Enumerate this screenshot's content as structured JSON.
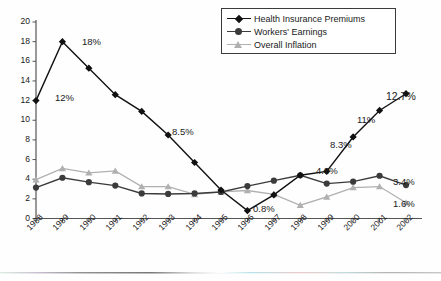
{
  "chart_data": {
    "type": "line",
    "title": "",
    "subtitle": "",
    "xlabel": "",
    "ylabel": "",
    "ylim": [
      0,
      20
    ],
    "ytick_step": 2,
    "grid": false,
    "legend_position": "top-right",
    "categories": [
      "1988",
      "1989",
      "1990",
      "1991",
      "1992",
      "1993",
      "1994",
      "1995",
      "1996",
      "1997",
      "1998",
      "1999",
      "2000",
      "2001",
      "2002"
    ],
    "yticks": [
      "0",
      "2",
      "4",
      "6",
      "8",
      "10",
      "12",
      "14",
      "16",
      "18",
      "20"
    ],
    "series": [
      {
        "name": "Health Insurance Premiums",
        "marker": "diamond",
        "color": "#111111",
        "values": [
          12,
          18,
          15.3,
          12.6,
          10.9,
          8.5,
          5.7,
          2.9,
          0.8,
          2.4,
          4.4,
          4.8,
          8.3,
          11,
          12.7
        ]
      },
      {
        "name": "Workers' Earnings",
        "marker": "circle",
        "color": "#3b3b3b",
        "values": [
          3.15,
          4.15,
          3.7,
          3.35,
          2.55,
          2.5,
          2.55,
          2.7,
          3.3,
          3.85,
          4.4,
          3.55,
          3.75,
          4.35,
          3.4
        ]
      },
      {
        "name": "Overall Inflation",
        "marker": "triangle",
        "color": "#b0b0b0",
        "values": [
          3.95,
          5.1,
          4.65,
          4.85,
          3.25,
          3.25,
          2.45,
          2.7,
          2.85,
          2.45,
          1.35,
          2.2,
          3.15,
          3.25,
          1.6
        ]
      }
    ],
    "annotations": [
      {
        "text": "12%",
        "series": "Health Insurance Premiums",
        "year": "1988",
        "x": 55,
        "y": 93
      },
      {
        "text": "18%",
        "series": "Health Insurance Premiums",
        "year": "1989",
        "x": 82,
        "y": 37
      },
      {
        "text": "8.5%",
        "series": "Health Insurance Premiums",
        "year": "1993",
        "x": 172,
        "y": 127
      },
      {
        "text": "0.8%",
        "series": "Health Insurance Premiums",
        "year": "1996",
        "x": 253,
        "y": 204
      },
      {
        "text": "4.8%",
        "series": "Health Insurance Premiums",
        "year": "1999",
        "x": 316,
        "y": 166
      },
      {
        "text": "8.3%",
        "series": "Health Insurance Premiums",
        "year": "2000",
        "x": 330,
        "y": 140
      },
      {
        "text": "11%",
        "series": "Health Insurance Premiums",
        "year": "2001",
        "x": 357,
        "y": 115
      },
      {
        "text": "12.7%",
        "series": "Health Insurance Premiums",
        "year": "2002",
        "x": 386,
        "y": 91
      },
      {
        "text": "3.4%",
        "series": "Workers' Earnings",
        "year": "2002",
        "x": 393,
        "y": 177
      },
      {
        "text": "1.6%",
        "series": "Overall Inflation",
        "year": "2002",
        "x": 393,
        "y": 199
      }
    ]
  }
}
